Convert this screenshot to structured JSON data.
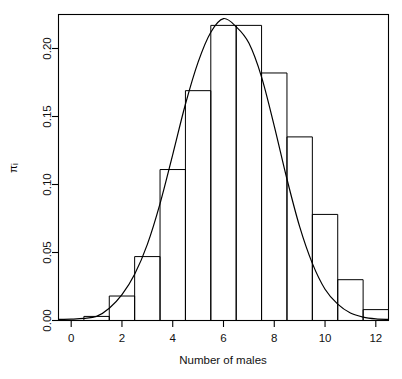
{
  "figure": {
    "background": "#ffffff",
    "foreground": "#000000",
    "width": 402,
    "height": 379
  },
  "axes": {
    "x_title": "Number of males",
    "y_title": "πᵢ",
    "x_ticks": [
      "0",
      "2",
      "4",
      "6",
      "8",
      "10",
      "12"
    ],
    "y_ticks": [
      "0.00",
      "0.05",
      "0.10",
      "0.15",
      "0.20"
    ]
  },
  "chart_data": {
    "type": "bar",
    "title": "",
    "subtitle": "",
    "xlabel": "Number of males",
    "ylabel": "πᵢ",
    "xlim": [
      -0.5,
      12.5
    ],
    "ylim": [
      0.0,
      0.225
    ],
    "grid": false,
    "legend": "none",
    "bar_style": "histogram-outline-unfilled",
    "bin_width": 1,
    "categories": [
      0,
      1,
      2,
      3,
      4,
      5,
      6,
      7,
      8,
      9,
      10,
      11,
      12
    ],
    "values": [
      0.0,
      0.003,
      0.018,
      0.047,
      0.111,
      0.169,
      0.217,
      0.217,
      0.182,
      0.135,
      0.078,
      0.03,
      0.008
    ],
    "series": [
      {
        "name": "observed relative frequency",
        "type": "bar",
        "values": [
          0.0,
          0.003,
          0.018,
          0.047,
          0.111,
          0.169,
          0.217,
          0.217,
          0.182,
          0.135,
          0.078,
          0.03,
          0.008
        ]
      },
      {
        "name": "fitted density curve",
        "type": "line",
        "x": [
          -0.5,
          0.0,
          0.5,
          1.0,
          1.5,
          2.0,
          2.5,
          3.0,
          3.5,
          4.0,
          4.5,
          5.0,
          5.5,
          6.0,
          6.5,
          7.0,
          7.5,
          8.0,
          8.5,
          9.0,
          9.5,
          10.0,
          10.5,
          11.0,
          11.5,
          12.0,
          12.5
        ],
        "y": [
          0.0008,
          0.001,
          0.0015,
          0.003,
          0.009,
          0.019,
          0.034,
          0.056,
          0.086,
          0.122,
          0.159,
          0.19,
          0.212,
          0.222,
          0.216,
          0.204,
          0.179,
          0.143,
          0.104,
          0.069,
          0.042,
          0.023,
          0.012,
          0.0055,
          0.0025,
          0.0012,
          0.0008
        ]
      }
    ],
    "x_tick_values": [
      0,
      2,
      4,
      6,
      8,
      10,
      12
    ],
    "y_tick_values": [
      0.0,
      0.05,
      0.1,
      0.15,
      0.2
    ]
  }
}
